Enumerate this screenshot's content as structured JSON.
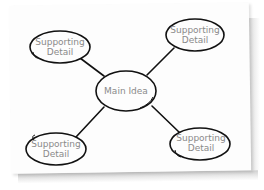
{
  "diagram": {
    "type": "mind-map",
    "center": {
      "label": "Main Idea"
    },
    "branches": [
      {
        "position": "top-left",
        "line1": "Supporting",
        "line2": "Detail"
      },
      {
        "position": "top-right",
        "line1": "Supporting",
        "line2": "Detail"
      },
      {
        "position": "bottom-left",
        "line1": "Supporting",
        "line2": "Detail"
      },
      {
        "position": "bottom-right",
        "line1": "Supporting",
        "line2": "Detail"
      }
    ],
    "colors": {
      "stroke": "#111111",
      "text": "#8a8a8a",
      "paper": "#fdfdfd"
    }
  }
}
